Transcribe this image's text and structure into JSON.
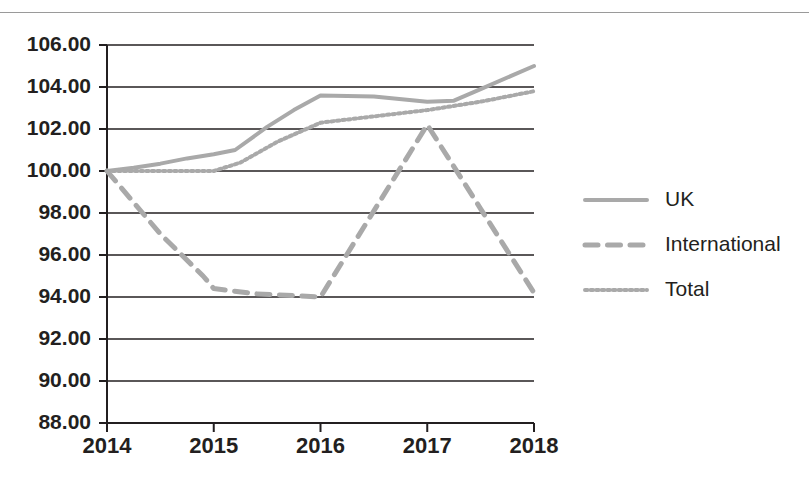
{
  "page": {
    "rule_color": "#9a9a9a",
    "background": "#ffffff"
  },
  "chart_data": {
    "type": "line",
    "title": "",
    "subtitle": "",
    "xlabel": "",
    "ylabel": "",
    "x": [
      2014,
      2015,
      2016,
      2017,
      2018
    ],
    "categories": [
      "2014",
      "2015",
      "2016",
      "2017",
      "2018"
    ],
    "xtick_labels": [
      "2014",
      "2015",
      "2016",
      "2017",
      "2018"
    ],
    "ytick_labels": [
      "106.00",
      "104.00",
      "102.00",
      "100.00",
      "98.00",
      "96.00",
      "94.00",
      "92.00",
      "90.00",
      "88.00"
    ],
    "ytick_values": [
      106,
      104,
      102,
      100,
      98,
      96,
      94,
      92,
      90,
      88
    ],
    "ylim": [
      88,
      106
    ],
    "xlim": [
      2014,
      2018
    ],
    "grid": true,
    "grid_axis": "y",
    "legend_position": "right",
    "series": [
      {
        "name": "UK",
        "style": "solid",
        "color": "#a9a9a9",
        "width": 4,
        "values": [
          100.0,
          100.8,
          103.6,
          103.3,
          105.0
        ],
        "vertices": [
          [
            2014.0,
            100.0
          ],
          [
            2014.25,
            100.15
          ],
          [
            2014.5,
            100.35
          ],
          [
            2014.75,
            100.6
          ],
          [
            2015.0,
            100.8
          ],
          [
            2015.2,
            101.0
          ],
          [
            2015.5,
            102.1
          ],
          [
            2015.75,
            102.9
          ],
          [
            2016.0,
            103.6
          ],
          [
            2016.5,
            103.55
          ],
          [
            2017.0,
            103.3
          ],
          [
            2017.25,
            103.35
          ],
          [
            2017.5,
            103.9
          ],
          [
            2018.0,
            105.0
          ]
        ]
      },
      {
        "name": "International",
        "style": "dashed",
        "color": "#a9a9a9",
        "width": 5,
        "values": [
          100.0,
          94.2,
          94.0,
          102.2,
          94.2
        ],
        "vertices": [
          [
            2014.0,
            100.0
          ],
          [
            2014.5,
            97.0
          ],
          [
            2014.9,
            95.0
          ],
          [
            2015.0,
            94.4
          ],
          [
            2015.4,
            94.15
          ],
          [
            2016.0,
            94.0
          ],
          [
            2016.5,
            98.1
          ],
          [
            2017.0,
            102.2
          ],
          [
            2017.5,
            98.2
          ],
          [
            2018.0,
            94.2
          ]
        ]
      },
      {
        "name": "Total",
        "style": "dotted",
        "color": "#a9a9a9",
        "width": 4,
        "values": [
          100.0,
          100.0,
          102.3,
          102.9,
          103.8
        ],
        "vertices": [
          [
            2014.0,
            100.0
          ],
          [
            2014.5,
            100.0
          ],
          [
            2015.0,
            100.0
          ],
          [
            2015.25,
            100.4
          ],
          [
            2015.6,
            101.4
          ],
          [
            2016.0,
            102.3
          ],
          [
            2016.5,
            102.6
          ],
          [
            2017.0,
            102.9
          ],
          [
            2017.5,
            103.3
          ],
          [
            2018.0,
            103.8
          ]
        ]
      }
    ],
    "legend": [
      {
        "label": "UK",
        "style": "solid",
        "color": "#a9a9a9"
      },
      {
        "label": "International",
        "style": "dashed",
        "color": "#a9a9a9"
      },
      {
        "label": "Total",
        "style": "dotted",
        "color": "#a9a9a9"
      }
    ]
  }
}
